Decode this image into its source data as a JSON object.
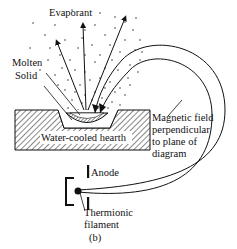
{
  "labels": {
    "evaporant": "Evaporant",
    "molten": "Molten",
    "solid": "Solid",
    "hearth": "Water-cooled hearth",
    "magnetic_1": "Magnetic field",
    "magnetic_2": "perpendicular",
    "magnetic_3": "to plane of",
    "magnetic_4": "diagram",
    "anode": "Anode",
    "thermionic": "Thermionic",
    "filament": "filament",
    "panel": "(b)"
  },
  "colors": {
    "ink": "#111111",
    "background": "#ffffff"
  }
}
